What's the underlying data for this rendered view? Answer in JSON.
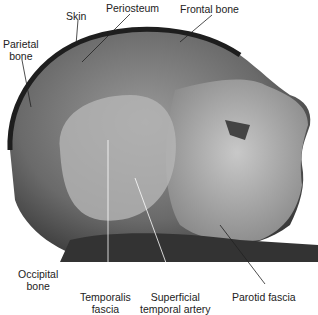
{
  "figure": {
    "labels": {
      "skin": "Skin",
      "periosteum": "Periosteum",
      "frontal_bone": "Frontal bone",
      "parietal_bone_1": "Parietal",
      "parietal_bone_2": "bone",
      "occipital_bone_1": "Occipital",
      "occipital_bone_2": "bone",
      "temporalis_fascia_1": "Temporalis",
      "temporalis_fascia_2": "fascia",
      "superficial_temporal_artery_1": "Superficial",
      "superficial_temporal_artery_2": "temporal artery",
      "parotid_fascia": "Parotid fascia"
    }
  }
}
